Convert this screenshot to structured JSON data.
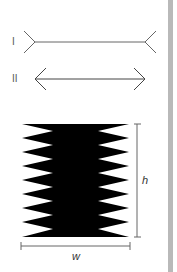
{
  "figure": {
    "illusion_lines": [
      {
        "label": "I",
        "style": "fins-outward"
      },
      {
        "label": "II",
        "style": "arrowheads"
      }
    ],
    "shape": {
      "description": "black rectangle with zigzag notched sides",
      "teeth_per_side": 8,
      "fill": "#000000"
    },
    "dimensions": {
      "height_label": "h",
      "width_label": "w"
    },
    "colors": {
      "line": "#555555",
      "shape": "#000000",
      "side_bar": "#b9b9b9",
      "background": "#ffffff"
    }
  }
}
